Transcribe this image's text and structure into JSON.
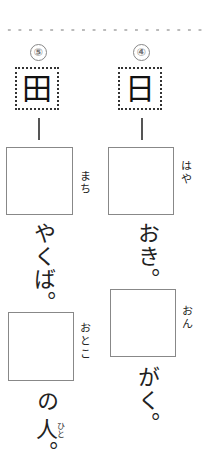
{
  "problems": [
    {
      "number": "⑤",
      "kanji": "田",
      "q1": {
        "ruby": "まち",
        "suffix": "やくば。"
      },
      "q2": {
        "ruby": "おとこ",
        "suffix": "の",
        "suffix2": "人。",
        "suffix2_ruby": "ひと"
      }
    },
    {
      "number": "④",
      "kanji": "日",
      "q1": {
        "ruby": "はや",
        "suffix": "おき。"
      },
      "q2": {
        "ruby": "おん",
        "suffix": "がく。"
      }
    }
  ]
}
